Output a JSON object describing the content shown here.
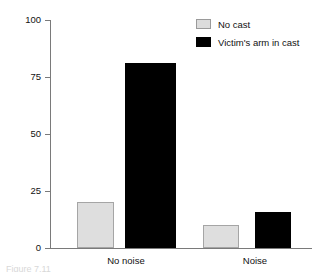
{
  "chart_data": {
    "type": "bar",
    "title": "",
    "xlabel": "",
    "ylabel": "Percentage of passers-by who helped",
    "categories": [
      "No noise",
      "Noise"
    ],
    "series": [
      {
        "name": "No cast",
        "values": [
          20,
          10
        ],
        "color": "#dedede"
      },
      {
        "name": "Victim's arm in cast",
        "values": [
          81,
          16
        ],
        "color": "#000000"
      }
    ],
    "ylim": [
      0,
      100
    ],
    "yticks": [
      0,
      25,
      50,
      75,
      100
    ],
    "ytick_labels": [
      "0",
      "25",
      "50",
      "75",
      "100"
    ],
    "grid": false,
    "legend_position": "top-right"
  },
  "axis": {
    "y_title": "Percentage of passers-by who helped",
    "ticks": [
      {
        "label": "100",
        "value": 100
      },
      {
        "label": "75",
        "value": 75
      },
      {
        "label": "50",
        "value": 50
      },
      {
        "label": "25",
        "value": 25
      },
      {
        "label": "0",
        "value": 0
      }
    ],
    "x_labels": [
      "No noise",
      "Noise"
    ]
  },
  "legend": {
    "items": [
      {
        "label": "No cast",
        "swatch": "nocast"
      },
      {
        "label": "Victim's arm in cast",
        "swatch": "cast"
      }
    ]
  },
  "bars": [
    {
      "name": "bar-no-noise-no-cast",
      "group": "No noise",
      "series": "No cast",
      "value": 20,
      "left": 27,
      "width": 37,
      "style": "nocast"
    },
    {
      "name": "bar-no-noise-cast",
      "group": "No noise",
      "series": "Victim's arm in cast",
      "value": 81,
      "left": 75,
      "width": 51,
      "style": "cast"
    },
    {
      "name": "bar-noise-no-cast",
      "group": "Noise",
      "series": "No cast",
      "value": 10,
      "left": 153,
      "width": 36,
      "style": "nocast"
    },
    {
      "name": "bar-noise-cast",
      "group": "Noise",
      "series": "Victim's arm in cast",
      "value": 16,
      "left": 205,
      "width": 36,
      "style": "cast"
    }
  ],
  "caption": {
    "text": "Figure 7.11"
  }
}
